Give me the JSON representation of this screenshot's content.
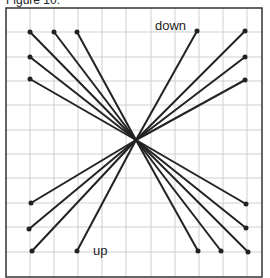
{
  "caption": "Figure 10:",
  "labels": {
    "down": "down",
    "up": "up"
  },
  "colors": {
    "line": "#222222",
    "grid": "#cfcfcf",
    "frame": "#333333"
  },
  "grid": {
    "left": 6,
    "top": 8,
    "right": 262,
    "bottom": 277,
    "cols": [
      30,
      54,
      78,
      102,
      126,
      151,
      175,
      199,
      223,
      247
    ],
    "rows": [
      32,
      57,
      81,
      105,
      130,
      154,
      178,
      203,
      227,
      252
    ]
  },
  "center": {
    "x": 136,
    "y": 140
  },
  "endpoints": [
    {
      "x": 30,
      "y": 32
    },
    {
      "x": 54,
      "y": 32
    },
    {
      "x": 77,
      "y": 32
    },
    {
      "x": 30,
      "y": 57
    },
    {
      "x": 30,
      "y": 79
    },
    {
      "x": 197,
      "y": 31
    },
    {
      "x": 245,
      "y": 31
    },
    {
      "x": 245,
      "y": 57
    },
    {
      "x": 245,
      "y": 80
    },
    {
      "x": 31,
      "y": 203
    },
    {
      "x": 29,
      "y": 229
    },
    {
      "x": 32,
      "y": 251
    },
    {
      "x": 77,
      "y": 251
    },
    {
      "x": 198,
      "y": 251
    },
    {
      "x": 221,
      "y": 251
    },
    {
      "x": 248,
      "y": 252
    },
    {
      "x": 246,
      "y": 228
    },
    {
      "x": 246,
      "y": 204
    }
  ]
}
